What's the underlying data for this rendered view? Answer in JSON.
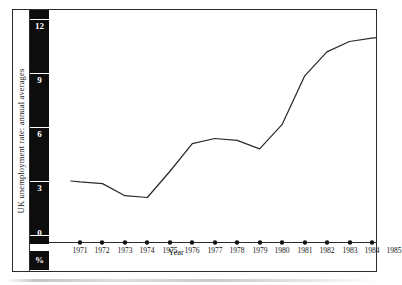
{
  "chart_data": {
    "type": "line",
    "title": "",
    "ylabel": "UK unemployment rate: annual averages",
    "yunit": "%",
    "xlabel": "Year",
    "categories": [
      1971,
      1972,
      1973,
      1974,
      1975,
      1976,
      1977,
      1978,
      1979,
      1980,
      1981,
      1982,
      1983,
      1984,
      1985
    ],
    "values": [
      3.5,
      3.4,
      2.7,
      2.6,
      4.1,
      5.7,
      6.0,
      5.9,
      5.4,
      6.8,
      9.6,
      11.0,
      11.6,
      11.8,
      11.9
    ],
    "ylim": [
      0,
      12.9
    ],
    "yticks": [
      0,
      3,
      6,
      9,
      12
    ],
    "ytick_labels": [
      "0",
      "3",
      "6",
      "9",
      "12"
    ],
    "xtick_labels": [
      "1971",
      "1972",
      "1973",
      "1974",
      "1975",
      "1976",
      "1977",
      "1978",
      "1979",
      "1980",
      "1981",
      "1982",
      "1983",
      "1984",
      "1985"
    ],
    "grid": false,
    "legend": false,
    "series_color": "#2b2b2b",
    "axis_color": "#2b2b2b",
    "scale_bar_color": "#0d0d0d",
    "scale_text_color": "#ffffff"
  }
}
